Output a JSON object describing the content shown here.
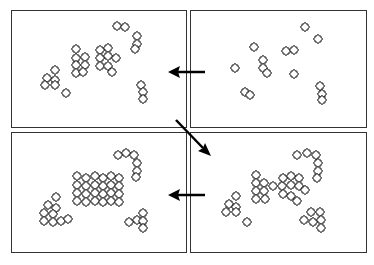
{
  "diagram": {
    "panels": [
      {
        "id": "top-right",
        "order": 1,
        "state": "scattered individual pieces"
      },
      {
        "id": "top-left",
        "order": 2,
        "state": "small clusters formed"
      },
      {
        "id": "bottom-right",
        "order": 3,
        "state": "larger clusters forming"
      },
      {
        "id": "bottom-left",
        "order": 4,
        "state": "large assembled grid with remaining clusters"
      }
    ],
    "arrows": [
      {
        "from": "top-right",
        "to": "top-left",
        "direction": "left"
      },
      {
        "from": "top-left",
        "to": "bottom-right",
        "direction": "down-right"
      },
      {
        "from": "bottom-right",
        "to": "bottom-left",
        "direction": "left"
      }
    ],
    "colors": {
      "stroke": "#111111",
      "background": "#ffffff",
      "frame": "#333333"
    }
  }
}
